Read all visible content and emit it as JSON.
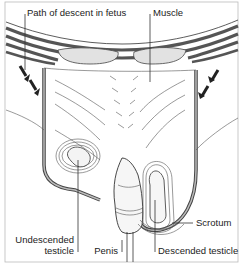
{
  "diagram": {
    "labels": {
      "path": "Path of descent in fetus",
      "muscle": "Muscle",
      "scrotum": "Scrotum",
      "undescended_line1": "Undescended",
      "undescended_line2": "testicle",
      "penis": "Penis",
      "descended": "Descended testicle"
    },
    "colors": {
      "ink": "#222222",
      "wall": "#9a9a9a",
      "muscle_fill": "#e2e2e2",
      "background": "#ffffff"
    }
  }
}
